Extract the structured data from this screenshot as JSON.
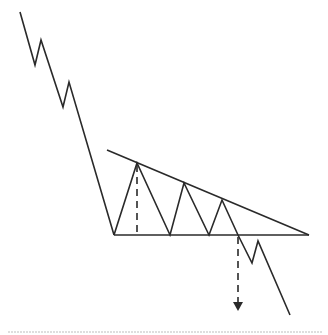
{
  "diagram": {
    "type": "descending-triangle-pattern",
    "colors": {
      "line": "#2a2a2a",
      "background": "#ffffff",
      "footer_rule": "#d4d4d4"
    },
    "prior_downtrend": [
      [
        20,
        12
      ],
      [
        35,
        65
      ],
      [
        41,
        40
      ],
      [
        63,
        107
      ],
      [
        69,
        82
      ],
      [
        114,
        235
      ]
    ],
    "triangle_swings": [
      [
        114,
        235
      ],
      [
        137,
        163
      ],
      [
        170,
        235
      ],
      [
        184,
        183
      ],
      [
        209,
        235
      ],
      [
        222,
        200
      ],
      [
        238,
        235
      ]
    ],
    "upper_trendline": {
      "from": [
        107,
        150
      ],
      "to": [
        309,
        235
      ]
    },
    "support_line": {
      "from": [
        114,
        235
      ],
      "to": [
        309,
        235
      ]
    },
    "breakdown_path": [
      [
        238,
        235
      ],
      [
        252,
        263
      ],
      [
        258,
        241
      ],
      [
        290,
        315
      ]
    ],
    "height_measure": {
      "from": [
        137,
        165
      ],
      "to": [
        137,
        233
      ]
    },
    "target_arrow": {
      "from": [
        238,
        237
      ],
      "to": [
        238,
        302
      ]
    },
    "footer_rule_y": 332
  }
}
